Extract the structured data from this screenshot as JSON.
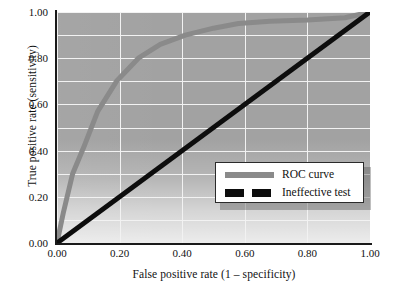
{
  "chart_data": {
    "type": "line",
    "title": "",
    "xlabel": "False positive rate (1 – specificity)",
    "ylabel": "True positive rate (sensitivity)",
    "xlim": [
      0.0,
      1.0
    ],
    "ylim": [
      0.0,
      1.0
    ],
    "xticks": [
      "0.00",
      "0.20",
      "0.40",
      "0.60",
      "0.80",
      "1.00"
    ],
    "yticks": [
      "0.00",
      "0.20",
      "0.40",
      "0.60",
      "0.80",
      "1.00"
    ],
    "xtick_values": [
      0.0,
      0.2,
      0.4,
      0.6,
      0.8,
      1.0
    ],
    "ytick_values": [
      0.0,
      0.2,
      0.4,
      0.6,
      0.8,
      1.0
    ],
    "grid": true,
    "grid_color": "#f2f2f2",
    "plot_background": "#a2a2a2",
    "legend_position": "lower right",
    "series": [
      {
        "name": "ROC curve",
        "color": "#8a8a8a",
        "style": "solid",
        "linewidth": 5,
        "x": [
          0.0,
          0.02,
          0.05,
          0.09,
          0.13,
          0.19,
          0.26,
          0.33,
          0.41,
          0.5,
          0.58,
          0.68,
          0.8,
          0.92,
          1.0
        ],
        "y": [
          0.0,
          0.13,
          0.3,
          0.43,
          0.57,
          0.7,
          0.8,
          0.86,
          0.9,
          0.93,
          0.95,
          0.96,
          0.965,
          0.975,
          1.0
        ]
      },
      {
        "name": "Ineffective test",
        "color": "#0d0d0d",
        "style": "dashed",
        "linewidth": 5,
        "x": [
          0.0,
          1.0
        ],
        "y": [
          0.0,
          1.0
        ]
      }
    ]
  },
  "legend": {
    "items": [
      {
        "label": "ROC curve",
        "color": "#8a8a8a",
        "style": "solid"
      },
      {
        "label": "Ineffective test",
        "color": "#0d0d0d",
        "style": "dashed"
      }
    ]
  },
  "colors": {
    "roc": "#8a8a8a",
    "diagonal": "#0d0d0d",
    "axis": "#1a1a1a",
    "grid": "#f2f2f2",
    "plot_bg": "#a2a2a2",
    "page_bg": "#ffffff"
  }
}
